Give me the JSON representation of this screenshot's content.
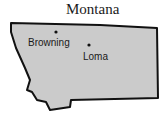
{
  "map": {
    "title": "Montana",
    "fill_color": "#cbcbcb",
    "outline_color": "#111111",
    "cities": [
      {
        "name": "Browning",
        "dot": [
          56,
          32
        ],
        "label": [
          28,
          46
        ]
      },
      {
        "name": "Loma",
        "dot": [
          89,
          45
        ],
        "label": [
          83,
          60
        ]
      }
    ]
  }
}
